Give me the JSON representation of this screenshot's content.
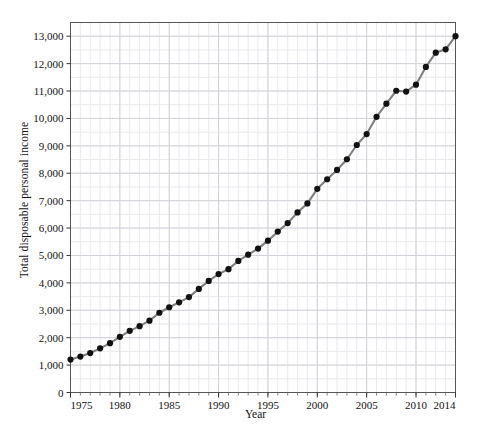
{
  "chart_data": {
    "type": "line",
    "title": "",
    "xlabel": "Year",
    "ylabel": "Total disposable personal income",
    "xlim": [
      1975,
      2014
    ],
    "ylim": [
      0,
      13500
    ],
    "grid": true,
    "legend": null,
    "minor_grid": true,
    "marker": "filled-circle",
    "line_color": "#808080",
    "marker_color": "#111111",
    "y_ticks": [
      0,
      1000,
      2000,
      3000,
      4000,
      5000,
      6000,
      7000,
      8000,
      9000,
      10000,
      11000,
      12000,
      13000
    ],
    "y_tick_labels": [
      "0",
      "1,000",
      "2,000",
      "3,000",
      "4,000",
      "5,000",
      "6,000",
      "7,000",
      "8,000",
      "9,000",
      "10,000",
      "11,000",
      "12,000",
      "13,000"
    ],
    "x_ticks": [
      1975,
      1980,
      1985,
      1990,
      1995,
      2000,
      2005,
      2010,
      2014
    ],
    "x_tick_labels": [
      "1975",
      "1980",
      "1985",
      "1990",
      "1995",
      "2000",
      "2005",
      "2010",
      "2014"
    ],
    "x": [
      1975,
      1976,
      1977,
      1978,
      1979,
      1980,
      1981,
      1982,
      1983,
      1984,
      1985,
      1986,
      1987,
      1988,
      1989,
      1990,
      1991,
      1992,
      1993,
      1994,
      1995,
      1996,
      1997,
      1998,
      1999,
      2000,
      2001,
      2002,
      2003,
      2004,
      2005,
      2006,
      2007,
      2008,
      2009,
      2010,
      2011,
      2012,
      2013,
      2014
    ],
    "values": [
      1200,
      1310,
      1440,
      1610,
      1800,
      2030,
      2250,
      2420,
      2620,
      2910,
      3110,
      3290,
      3480,
      3780,
      4070,
      4320,
      4500,
      4800,
      5030,
      5250,
      5540,
      5870,
      6180,
      6570,
      6900,
      7430,
      7780,
      8120,
      8510,
      9030,
      9430,
      10060,
      10540,
      11010,
      10980,
      11230,
      11880,
      12400,
      12520,
      13000
    ]
  },
  "axis": {
    "y_title": "Total disposable personal income",
    "x_title": "Year"
  }
}
